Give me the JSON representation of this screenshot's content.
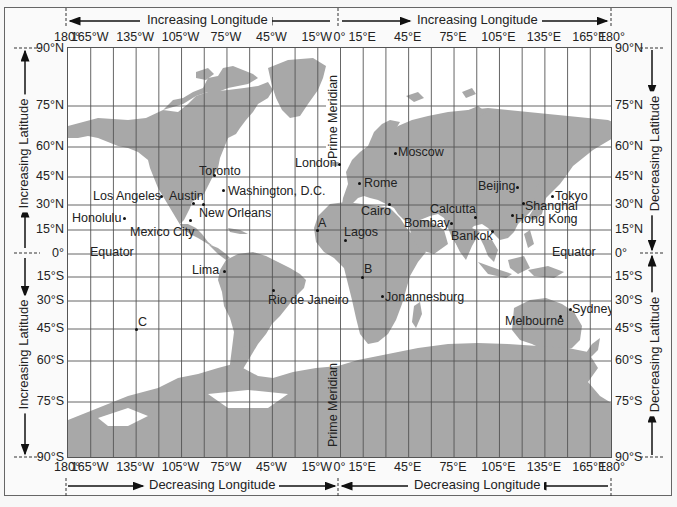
{
  "map": {
    "title": "World latitude and longitude grid",
    "land_color": "#a8a8a8",
    "grid_color": "#555555",
    "top_labels": {
      "left": "Increasing Longitude",
      "right": "Increasing Longitude"
    },
    "bottom_labels": {
      "left": "Decreasing Longitude",
      "right": "Decreasing Longitude"
    },
    "left_labels": {
      "top": "Increasing Latitude",
      "bottom": "Increasing Latitude"
    },
    "right_labels": {
      "top": "Decreasing Latitude",
      "bottom": "Decreasing Latitude"
    },
    "prime_meridian_label": "Prime Meridian",
    "equator_label": "Equator",
    "longitude_ticks": [
      "180°",
      "165°W",
      "135°W",
      "105°W",
      "75°W",
      "45°W",
      "15°W",
      "0°",
      "15°E",
      "45°E",
      "75°E",
      "105°E",
      "135°E",
      "165°E",
      "180°"
    ],
    "latitude_ticks": [
      "90°N",
      "75°N",
      "60°N",
      "45°N",
      "30°N",
      "15°N",
      "0°",
      "15°S",
      "30°S",
      "45°S",
      "60°S",
      "75°S",
      "90°S"
    ],
    "cities": [
      {
        "name": "Toronto",
        "lon": -79,
        "lat": 44
      },
      {
        "name": "Los Angeles",
        "lon": -118,
        "lat": 34
      },
      {
        "name": "Austin",
        "lon": -97,
        "lat": 30
      },
      {
        "name": "Washington, D.C.",
        "lon": -77,
        "lat": 39
      },
      {
        "name": "New Orleans",
        "lon": -90,
        "lat": 30
      },
      {
        "name": "Honolulu",
        "lon": -158,
        "lat": 21
      },
      {
        "name": "Mexico City",
        "lon": -99,
        "lat": 19
      },
      {
        "name": "Lima",
        "lon": -77,
        "lat": -12
      },
      {
        "name": "Rio de Janeiro",
        "lon": -43,
        "lat": -23
      },
      {
        "name": "London",
        "lon": 0,
        "lat": 51
      },
      {
        "name": "Moscow",
        "lon": 37,
        "lat": 56
      },
      {
        "name": "Rome",
        "lon": 12,
        "lat": 42
      },
      {
        "name": "Cairo",
        "lon": 31,
        "lat": 30
      },
      {
        "name": "Lagos",
        "lon": 3,
        "lat": 6
      },
      {
        "name": "Jonannesburg",
        "lon": 28,
        "lat": -26
      },
      {
        "name": "Bombay",
        "lon": 73,
        "lat": 19
      },
      {
        "name": "Calcutta",
        "lon": 88,
        "lat": 22
      },
      {
        "name": "Bankok",
        "lon": 100,
        "lat": 14
      },
      {
        "name": "Beijing",
        "lon": 116,
        "lat": 40
      },
      {
        "name": "Shanghai",
        "lon": 121,
        "lat": 31
      },
      {
        "name": "Hong Kong",
        "lon": 114,
        "lat": 22
      },
      {
        "name": "Tokyo",
        "lon": 140,
        "lat": 36
      },
      {
        "name": "Sydney",
        "lon": 151,
        "lat": -34
      },
      {
        "name": "Melbourne",
        "lon": 145,
        "lat": -38
      }
    ],
    "points": [
      {
        "label": "A",
        "lon": -17,
        "lat": 15
      },
      {
        "label": "B",
        "lon": 12,
        "lat": -15
      },
      {
        "label": "C",
        "lon": -135,
        "lat": -45
      }
    ]
  }
}
